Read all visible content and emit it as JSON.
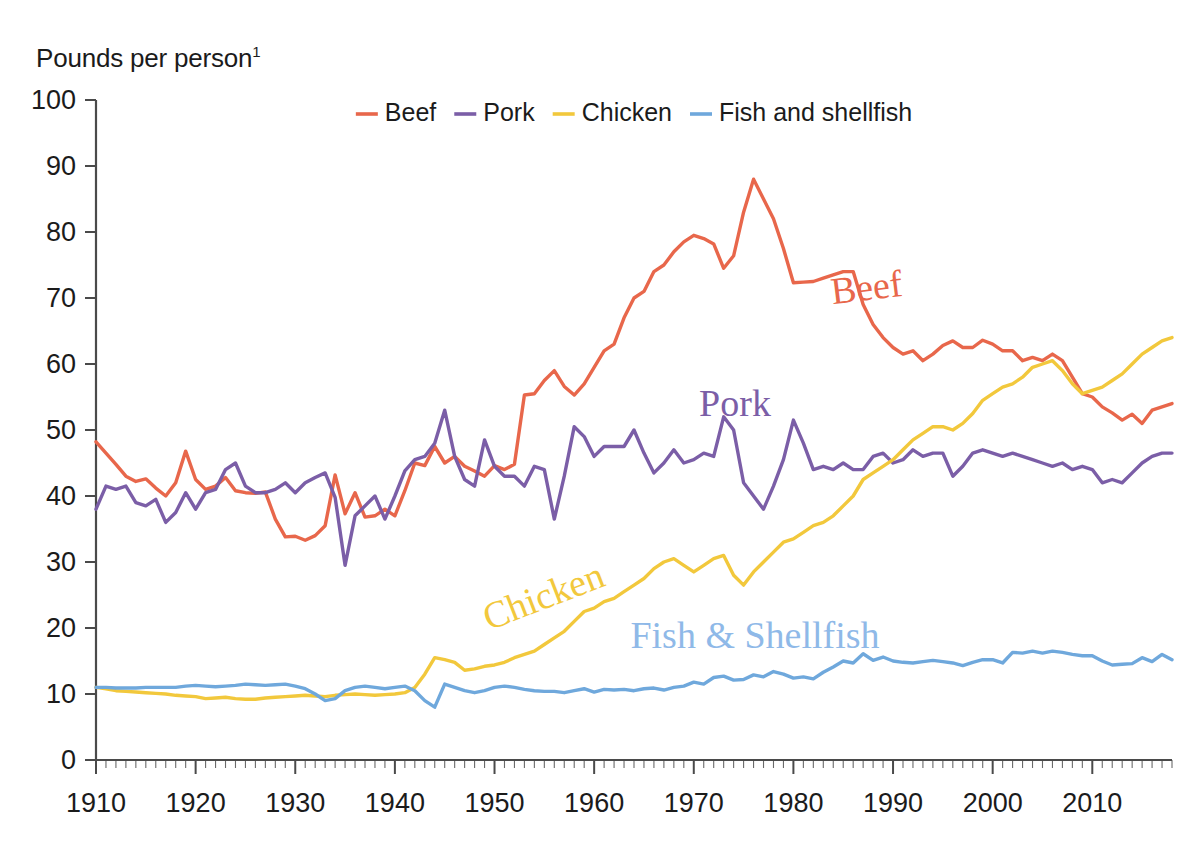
{
  "axis_title": "Pounds per person",
  "axis_title_footnote": "1",
  "legend": {
    "position": "top-center",
    "items": [
      {
        "label": "Beef",
        "color": "#E8674B"
      },
      {
        "label": "Pork",
        "color": "#7B5EA7"
      },
      {
        "label": "Chicken",
        "color": "#F2C83C"
      },
      {
        "label": "Fish and shellfish",
        "color": "#6FA8DC"
      }
    ]
  },
  "annotations": [
    {
      "name": "beef",
      "text": "Beef",
      "color": "#E8674B",
      "x": 868,
      "y": 300,
      "rotate": -7
    },
    {
      "name": "pork",
      "text": "Pork",
      "color": "#7B5EA7",
      "x": 735,
      "y": 416,
      "rotate": 0
    },
    {
      "name": "chicken",
      "text": "Chicken",
      "color": "#F2C83C",
      "x": 548,
      "y": 608,
      "rotate": -21
    },
    {
      "name": "fish",
      "text": "Fish & Shellfish",
      "color": "#8FB9E8",
      "x": 755,
      "y": 648,
      "rotate": 0
    }
  ],
  "chart_data": {
    "type": "line",
    "title": "",
    "ylabel": "Pounds per person",
    "xlabel": "",
    "ylim": [
      0,
      100
    ],
    "ytick_labels": [
      "0",
      "10",
      "20",
      "30",
      "40",
      "50",
      "60",
      "70",
      "80",
      "90",
      "100"
    ],
    "yticks": [
      0,
      10,
      20,
      30,
      40,
      50,
      60,
      70,
      80,
      90,
      100
    ],
    "xlim": [
      1910,
      2018
    ],
    "xtick_labels": [
      "1910",
      "1920",
      "1930",
      "1940",
      "1950",
      "1960",
      "1970",
      "1980",
      "1990",
      "2000",
      "2010"
    ],
    "xticks": [
      1910,
      1920,
      1930,
      1940,
      1950,
      1960,
      1970,
      1980,
      1990,
      2000,
      2010
    ],
    "minor_tick_interval": 1,
    "grid": false,
    "x": [
      1910,
      1911,
      1912,
      1913,
      1914,
      1915,
      1916,
      1917,
      1918,
      1919,
      1920,
      1921,
      1922,
      1923,
      1924,
      1925,
      1926,
      1927,
      1928,
      1929,
      1930,
      1931,
      1932,
      1933,
      1934,
      1935,
      1936,
      1937,
      1938,
      1939,
      1940,
      1941,
      1942,
      1943,
      1944,
      1945,
      1946,
      1947,
      1948,
      1949,
      1950,
      1951,
      1952,
      1953,
      1954,
      1955,
      1956,
      1957,
      1958,
      1959,
      1960,
      1961,
      1962,
      1963,
      1964,
      1965,
      1966,
      1967,
      1968,
      1969,
      1970,
      1971,
      1972,
      1973,
      1974,
      1975,
      1976,
      1977,
      1978,
      1979,
      1980,
      1981,
      1982,
      1983,
      1984,
      1985,
      1986,
      1987,
      1988,
      1989,
      1990,
      1991,
      1992,
      1993,
      1994,
      1995,
      1996,
      1997,
      1998,
      1999,
      2000,
      2001,
      2002,
      2003,
      2004,
      2005,
      2006,
      2007,
      2008,
      2009,
      2010,
      2011,
      2012,
      2013,
      2014,
      2015,
      2016,
      2017,
      2018
    ],
    "series": [
      {
        "name": "Beef",
        "color": "#E8674B",
        "values": [
          48.2,
          46.5,
          44.8,
          43.0,
          42.2,
          42.6,
          41.2,
          40.0,
          42.0,
          46.8,
          42.5,
          41.0,
          41.5,
          42.8,
          40.8,
          40.5,
          40.4,
          40.6,
          36.5,
          33.8,
          33.9,
          33.3,
          34.0,
          35.5,
          43.2,
          37.3,
          40.5,
          36.8,
          37.0,
          38.0,
          37.0,
          40.8,
          45.0,
          44.6,
          47.5,
          45.0,
          46.0,
          44.5,
          43.8,
          43.0,
          44.6,
          44.0,
          44.8,
          55.3,
          55.5,
          57.5,
          59.0,
          56.6,
          55.3,
          57.0,
          59.5,
          62.0,
          63.0,
          67.0,
          70.0,
          71.0,
          74.0,
          75.0,
          77.0,
          78.5,
          79.5,
          79.0,
          78.2,
          74.5,
          76.4,
          83.0,
          88.0,
          85.0,
          82.0,
          77.5,
          72.3,
          72.4,
          72.5,
          73.0,
          73.5,
          74.0,
          74.0,
          69.0,
          66.0,
          64.0,
          62.5,
          61.5,
          62.0,
          60.5,
          61.5,
          62.8,
          63.5,
          62.5,
          62.5,
          63.6,
          63.0,
          62.0,
          62.0,
          60.5,
          61.0,
          60.5,
          61.5,
          60.5,
          58.0,
          55.5,
          55.0,
          53.5,
          52.6,
          51.5,
          52.4,
          51.0,
          53.0,
          53.5,
          54.0
        ]
      },
      {
        "name": "Pork",
        "color": "#7B5EA7",
        "values": [
          38.0,
          41.5,
          41.0,
          41.5,
          39.0,
          38.5,
          39.5,
          36.0,
          37.5,
          40.5,
          38.0,
          40.5,
          41.0,
          44.0,
          45.0,
          41.5,
          40.5,
          40.5,
          41.0,
          42.0,
          40.5,
          42.0,
          42.8,
          43.5,
          39.8,
          29.5,
          37.0,
          38.5,
          40.0,
          36.5,
          40.0,
          43.8,
          45.5,
          46.0,
          48.0,
          53.0,
          46.0,
          42.5,
          41.5,
          48.5,
          44.5,
          43.0,
          43.0,
          41.5,
          44.5,
          44.0,
          36.5,
          43.0,
          50.5,
          49.0,
          46.0,
          47.5,
          47.5,
          47.5,
          50.0,
          46.5,
          43.5,
          45.0,
          47.0,
          45.0,
          45.5,
          46.5,
          46.0,
          52.0,
          50.0,
          42.0,
          40.0,
          38.0,
          41.5,
          45.5,
          51.5,
          48.0,
          44.0,
          44.5,
          44.0,
          45.0,
          44.0,
          44.0,
          46.0,
          46.5,
          45.0,
          45.5,
          47.0,
          46.0,
          46.5,
          46.5,
          43.0,
          44.5,
          46.5,
          47.0,
          46.5,
          46.0,
          46.5,
          46.0,
          45.5,
          45.0,
          44.5,
          45.0,
          44.0,
          44.5,
          44.0,
          42.0,
          42.5,
          42.0,
          43.5,
          45.0,
          46.0,
          46.5,
          46.5
        ]
      },
      {
        "name": "Chicken",
        "color": "#F2C83C",
        "values": [
          11.0,
          10.8,
          10.5,
          10.4,
          10.3,
          10.2,
          10.1,
          10.0,
          9.8,
          9.7,
          9.6,
          9.3,
          9.4,
          9.5,
          9.3,
          9.2,
          9.2,
          9.4,
          9.5,
          9.6,
          9.7,
          9.8,
          9.7,
          9.6,
          9.8,
          9.9,
          10.0,
          9.9,
          9.8,
          9.9,
          10.0,
          10.2,
          11.0,
          13.0,
          15.5,
          15.2,
          14.8,
          13.6,
          13.8,
          14.2,
          14.4,
          14.8,
          15.5,
          16.0,
          16.5,
          17.5,
          18.5,
          19.5,
          21.0,
          22.5,
          23.0,
          24.0,
          24.5,
          25.5,
          26.5,
          27.5,
          29.0,
          30.0,
          30.5,
          29.5,
          28.5,
          29.5,
          30.5,
          31.0,
          28.0,
          26.5,
          28.5,
          30.0,
          31.5,
          33.0,
          33.5,
          34.5,
          35.5,
          36.0,
          37.0,
          38.5,
          40.0,
          42.5,
          43.5,
          44.5,
          45.5,
          47.0,
          48.5,
          49.5,
          50.5,
          50.5,
          50.0,
          51.0,
          52.5,
          54.5,
          55.5,
          56.5,
          57.0,
          58.0,
          59.5,
          60.0,
          60.5,
          59.0,
          57.0,
          55.5,
          56.0,
          56.5,
          57.5,
          58.5,
          60.0,
          61.5,
          62.5,
          63.5,
          64.0
        ]
      },
      {
        "name": "Fish and shellfish",
        "color": "#6FA8DC",
        "values": [
          11.0,
          11.0,
          10.9,
          10.9,
          10.9,
          11.0,
          11.0,
          11.0,
          11.0,
          11.2,
          11.3,
          11.2,
          11.1,
          11.2,
          11.3,
          11.5,
          11.4,
          11.3,
          11.4,
          11.5,
          11.2,
          10.8,
          10.0,
          9.0,
          9.3,
          10.5,
          11.0,
          11.2,
          11.0,
          10.8,
          11.0,
          11.2,
          10.5,
          9.0,
          8.0,
          11.5,
          11.0,
          10.5,
          10.2,
          10.5,
          11.0,
          11.2,
          11.0,
          10.7,
          10.5,
          10.4,
          10.4,
          10.2,
          10.5,
          10.8,
          10.3,
          10.7,
          10.6,
          10.7,
          10.5,
          10.8,
          10.9,
          10.6,
          11.0,
          11.2,
          11.8,
          11.5,
          12.5,
          12.7,
          12.1,
          12.2,
          12.9,
          12.6,
          13.4,
          13.0,
          12.4,
          12.6,
          12.3,
          13.3,
          14.1,
          15.0,
          14.7,
          16.1,
          15.1,
          15.6,
          15.0,
          14.8,
          14.7,
          14.9,
          15.1,
          14.9,
          14.7,
          14.3,
          14.8,
          15.2,
          15.2,
          14.7,
          16.3,
          16.2,
          16.5,
          16.2,
          16.5,
          16.3,
          16.0,
          15.8,
          15.8,
          15.0,
          14.4,
          14.5,
          14.6,
          15.5,
          14.9,
          16.0,
          15.2
        ]
      }
    ]
  }
}
